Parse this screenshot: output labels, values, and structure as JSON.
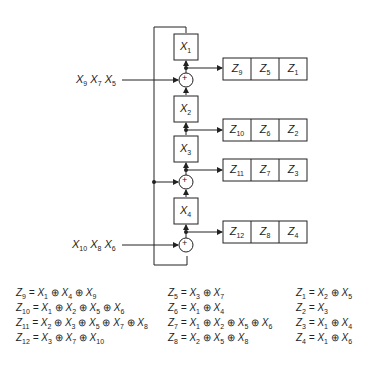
{
  "diagram": {
    "registers": [
      {
        "id": "X1",
        "label": "X",
        "sub": "1"
      },
      {
        "id": "X2",
        "label": "X",
        "sub": "2"
      },
      {
        "id": "X3",
        "label": "X",
        "sub": "3"
      },
      {
        "id": "X4",
        "label": "X",
        "sub": "4"
      }
    ],
    "adder_symbol": "+",
    "inputs": [
      {
        "id": "input-top",
        "terms": [
          {
            "v": "X",
            "s": "9"
          },
          {
            "v": "X",
            "s": "7"
          },
          {
            "v": "X",
            "s": "5"
          }
        ]
      },
      {
        "id": "input-bottom",
        "terms": [
          {
            "v": "X",
            "s": "10"
          },
          {
            "v": "X",
            "s": "8"
          },
          {
            "v": "X",
            "s": "6"
          }
        ]
      }
    ],
    "output_rows": [
      {
        "cells": [
          {
            "v": "Z",
            "s": "9"
          },
          {
            "v": "Z",
            "s": "5"
          },
          {
            "v": "Z",
            "s": "1"
          }
        ]
      },
      {
        "cells": [
          {
            "v": "Z",
            "s": "10"
          },
          {
            "v": "Z",
            "s": "6"
          },
          {
            "v": "Z",
            "s": "2"
          }
        ]
      },
      {
        "cells": [
          {
            "v": "Z",
            "s": "11"
          },
          {
            "v": "Z",
            "s": "7"
          },
          {
            "v": "Z",
            "s": "3"
          }
        ]
      },
      {
        "cells": [
          {
            "v": "Z",
            "s": "12"
          },
          {
            "v": "Z",
            "s": "8"
          },
          {
            "v": "Z",
            "s": "4"
          }
        ]
      }
    ]
  },
  "equations": {
    "col1": [
      {
        "lhs": "9",
        "rhs": [
          "1",
          "4",
          "9"
        ]
      },
      {
        "lhs": "10",
        "rhs": [
          "1",
          "2",
          "5",
          "6"
        ]
      },
      {
        "lhs": "11",
        "rhs": [
          "2",
          "3",
          "5",
          "7",
          "8"
        ]
      },
      {
        "lhs": "12",
        "rhs": [
          "3",
          "7",
          "10"
        ]
      }
    ],
    "col2": [
      {
        "lhs": "5",
        "rhs": [
          "3",
          "7"
        ]
      },
      {
        "lhs": "6",
        "rhs": [
          "1",
          "4"
        ]
      },
      {
        "lhs": "7",
        "rhs": [
          "1",
          "2",
          "5",
          "6"
        ]
      },
      {
        "lhs": "8",
        "rhs": [
          "2",
          "5",
          "8"
        ]
      }
    ],
    "col3": [
      {
        "lhs": "1",
        "rhs": [
          "2",
          "5"
        ]
      },
      {
        "lhs": "2",
        "rhs": [
          "3"
        ]
      },
      {
        "lhs": "3",
        "rhs": [
          "1",
          "4"
        ]
      },
      {
        "lhs": "4",
        "rhs": [
          "1",
          "6"
        ]
      }
    ],
    "xor_symbol": "⊕",
    "lhs_var": "Z",
    "rhs_var": "X"
  }
}
